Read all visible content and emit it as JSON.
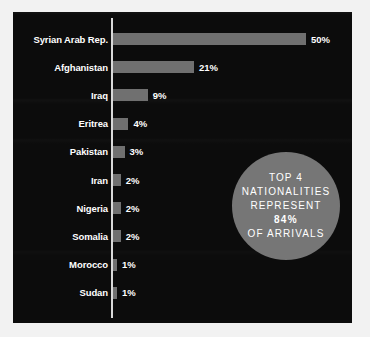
{
  "chart_data": {
    "type": "bar",
    "orientation": "horizontal",
    "title": "",
    "xlabel": "",
    "ylabel": "",
    "xlim": [
      0,
      50
    ],
    "grid": false,
    "legend": null,
    "categories": [
      "Syrian Arab Rep.",
      "Afghanistan",
      "Iraq",
      "Eritrea",
      "Pakistan",
      "Iran",
      "Nigeria",
      "Somalia",
      "Morocco",
      "Sudan"
    ],
    "values": [
      50,
      21,
      9,
      4,
      3,
      2,
      2,
      2,
      1,
      1
    ],
    "value_labels": [
      "50%",
      "21%",
      "9%",
      "4%",
      "3%",
      "2%",
      "2%",
      "2%",
      "1%",
      "1%"
    ],
    "bar_color": "#707070",
    "background_color": "#0c0c0c",
    "text_color": "#ffffff",
    "axis_color": "#d9d9d9"
  },
  "callout": {
    "shape": "circle",
    "fill_color": "#767676",
    "lines": [
      {
        "text": "TOP 4",
        "emphasis": false
      },
      {
        "text": "NATIONALITIES",
        "emphasis": false
      },
      {
        "text": "REPRESENT",
        "emphasis": false
      },
      {
        "text": "84%",
        "emphasis": true
      },
      {
        "text": "OF ARRIVALS",
        "emphasis": false
      }
    ]
  }
}
